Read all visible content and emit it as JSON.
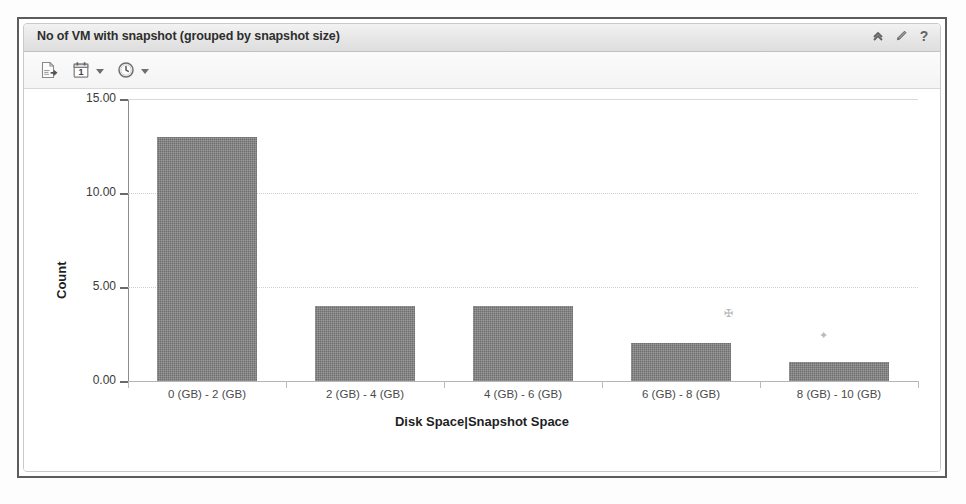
{
  "panel": {
    "title": "No of VM with snapshot (grouped by snapshot size)",
    "header_tools": [
      {
        "name": "collapse-icon",
        "label": "Collapse"
      },
      {
        "name": "edit-icon",
        "label": "Edit"
      },
      {
        "name": "help-icon",
        "label": "?"
      }
    ],
    "toolbar": [
      {
        "name": "export-icon",
        "label": "Export",
        "has_caret": false
      },
      {
        "name": "calendar-icon",
        "label": "Date Range",
        "value": "1",
        "has_caret": true
      },
      {
        "name": "clock-icon",
        "label": "Time Range",
        "has_caret": true
      }
    ]
  },
  "chart_data": {
    "type": "bar",
    "title": "No of VM with snapshot (grouped by snapshot size)",
    "xlabel": "Disk Space|Snapshot Space",
    "ylabel": "Count",
    "categories": [
      "0 (GB) - 2 (GB)",
      "2 (GB) - 4 (GB)",
      "4 (GB) - 6 (GB)",
      "6 (GB) - 8 (GB)",
      "8 (GB) - 10 (GB)"
    ],
    "values": [
      13,
      4,
      4,
      2,
      1
    ],
    "ylim": [
      0,
      15
    ],
    "yticks": [
      0,
      5,
      10,
      15
    ],
    "ytick_labels": [
      "0.00",
      "5.00",
      "10.00",
      "15.00"
    ],
    "grid": true,
    "legend": false,
    "bar_color": "#6e6e6e"
  }
}
